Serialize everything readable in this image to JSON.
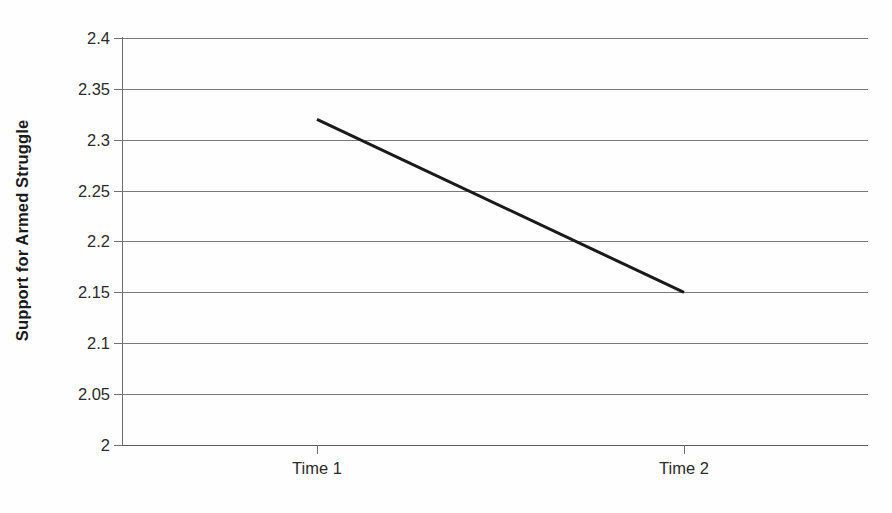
{
  "chart_data": {
    "type": "line",
    "title": "",
    "xlabel": "",
    "ylabel": "Support for Armed Struggle",
    "categories": [
      "Time 1",
      "Time 2"
    ],
    "series": [
      {
        "name": "Support for Armed Struggle",
        "values": [
          2.32,
          2.15
        ]
      }
    ],
    "ylim": [
      2,
      2.4
    ],
    "ytick_values": [
      2,
      2.05,
      2.1,
      2.15,
      2.2,
      2.25,
      2.3,
      2.35,
      2.4
    ],
    "ytick_labels": [
      "2",
      "2.05",
      "2.1",
      "2.15",
      "2.2",
      "2.25",
      "2.3",
      "2.35",
      "2.4"
    ],
    "grid": true,
    "legend": false,
    "legend_position": "none",
    "line_color": "#1a1a1a",
    "grid_color": "#7a7a7a",
    "axis_color": "#6e6e6e",
    "background_color": "#fefefe"
  },
  "axes": {
    "y_title": "Support for Armed Struggle",
    "y_ticks": [
      {
        "label": "2.4",
        "value": 2.4
      },
      {
        "label": "2.35",
        "value": 2.35
      },
      {
        "label": "2.3",
        "value": 2.3
      },
      {
        "label": "2.25",
        "value": 2.25
      },
      {
        "label": "2.2",
        "value": 2.2
      },
      {
        "label": "2.15",
        "value": 2.15
      },
      {
        "label": "2.1",
        "value": 2.1
      },
      {
        "label": "2.05",
        "value": 2.05
      },
      {
        "label": "2",
        "value": 2
      }
    ],
    "x_ticks": [
      {
        "label": "Time 1",
        "value": 2.32
      },
      {
        "label": "Time 2",
        "value": 2.15
      }
    ]
  }
}
